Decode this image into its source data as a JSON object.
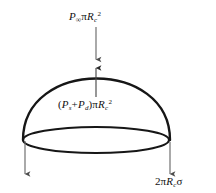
{
  "figure": {
    "type": "force-balance-diagram",
    "background_color": "#ffffff",
    "stroke_color": "#1a1a1a",
    "arrow_color": "#555555"
  },
  "labels": {
    "top_pressure": {
      "name": "ambient-pressure-force",
      "symbol": "P",
      "symbol_subscript": "∞",
      "factor_greek": "π",
      "radius_symbol": "R",
      "radius_subscript": "c",
      "exponent": "2",
      "full_text": "P∞πRc2"
    },
    "internal_pressure": {
      "name": "internal-pressure-force",
      "open_paren": "(",
      "first_symbol": "P",
      "first_subscript": "s",
      "operator": "+",
      "second_symbol": "P",
      "second_subscript": "d",
      "close_paren": ")",
      "factor_greek": "π",
      "radius_symbol": "R",
      "radius_subscript": "c",
      "exponent": "2",
      "full_text": "(Ps + Pd)πRc2"
    },
    "surface_tension": {
      "name": "surface-tension-force",
      "coefficient": "2",
      "factor_greek": "π",
      "radius_symbol": "R",
      "radius_subscript": "c",
      "sigma": "σ",
      "full_text": "2πRcσ"
    }
  },
  "geometry": {
    "dome": {
      "apex_x": 96,
      "apex_y": 63,
      "left_x": 23,
      "right_x": 170,
      "base_y": 140
    },
    "base_ellipse": {
      "cx": 96,
      "cy": 140,
      "rx": 73,
      "ry": 13
    },
    "arrows": [
      {
        "name": "top-down-arrow",
        "x1": 96,
        "y1": 27,
        "x2": 96,
        "y2": 61,
        "direction": "down"
      },
      {
        "name": "internal-up-arrow",
        "x1": 96,
        "y1": 97,
        "x2": 96,
        "y2": 66,
        "direction": "up"
      },
      {
        "name": "left-tension-arrow",
        "x1": 25,
        "y1": 141,
        "x2": 25,
        "y2": 177,
        "direction": "down"
      },
      {
        "name": "right-tension-arrow",
        "x1": 170,
        "y1": 142,
        "x2": 170,
        "y2": 177,
        "direction": "down"
      }
    ]
  }
}
